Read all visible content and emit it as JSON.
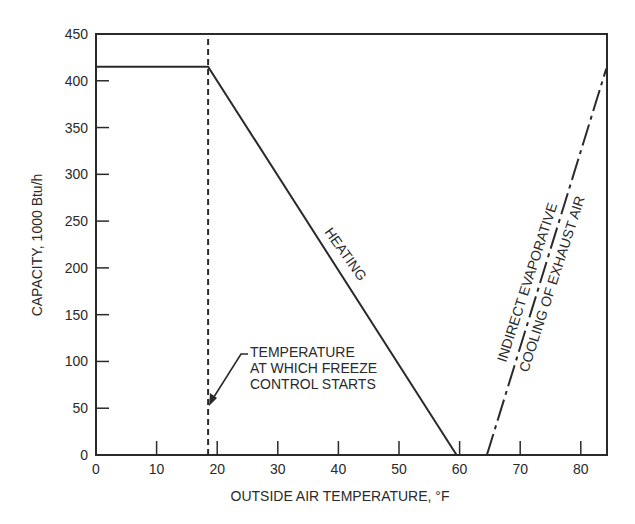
{
  "chart_data": {
    "type": "line",
    "title": "",
    "xlabel": "OUTSIDE AIR TEMPERATURE, °F",
    "ylabel": "CAPACITY, 1000 Btu/h",
    "xlim": [
      0,
      84.2
    ],
    "ylim": [
      0,
      450
    ],
    "x_ticks": [
      0,
      10,
      20,
      30,
      40,
      50,
      60,
      70,
      80
    ],
    "y_ticks": [
      0,
      50,
      100,
      150,
      200,
      250,
      300,
      350,
      400,
      450
    ],
    "grid": false,
    "legend": null,
    "series": [
      {
        "name": "HEATING",
        "style": "solid",
        "x": [
          0,
          18.5,
          59.5
        ],
        "y": [
          415,
          415,
          0
        ]
      },
      {
        "name": "INDIRECT EVAPORATIVE COOLING OF EXHAUST AIR",
        "style": "dash-dot",
        "x": [
          64.5,
          84.2
        ],
        "y": [
          0,
          413
        ]
      },
      {
        "name": "Freeze control start temperature",
        "style": "dashed-vertical",
        "x": [
          18.5,
          18.5
        ],
        "y": [
          0,
          450
        ]
      }
    ],
    "annotations": [
      {
        "text_lines": [
          "TEMPERATURE",
          "AT WHICH FREEZE",
          "CONTROL STARTS"
        ],
        "arrow_to": [
          18.5,
          55
        ]
      },
      {
        "text": "HEATING",
        "along_series": "HEATING"
      },
      {
        "text_lines": [
          "INDIRECT EVAPORATIVE",
          "COOLING OF EXHAUST AIR"
        ],
        "along_series": "INDIRECT EVAPORATIVE COOLING OF EXHAUST AIR"
      }
    ]
  },
  "labels": {
    "xlabel": "OUTSIDE AIR TEMPERATURE, °F",
    "ylabel": "CAPACITY, 1000 Btu/h",
    "heating": "HEATING",
    "cooling_line1": "INDIRECT EVAPORATIVE",
    "cooling_line2": "COOLING OF EXHAUST AIR",
    "freeze_line1": "TEMPERATURE",
    "freeze_line2": "AT WHICH FREEZE",
    "freeze_line3": "CONTROL STARTS"
  }
}
